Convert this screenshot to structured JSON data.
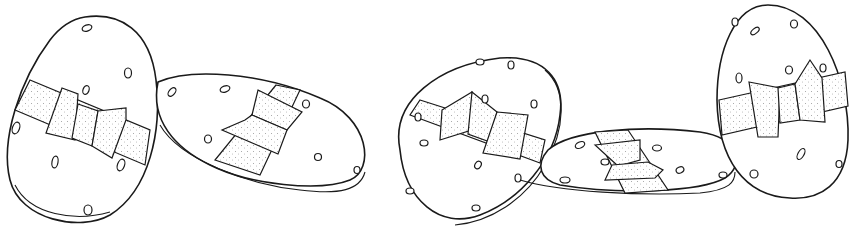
{
  "illustration": {
    "subject": "Four decorated Easter eggs with ribbon bows, line drawing",
    "style": "black ink outline on white, stippled ribbon",
    "colors": {
      "background": "#ffffff",
      "ink": "#1a1a1a"
    },
    "eggs": [
      {
        "name": "egg-1",
        "pose": "upright tilted left, front view"
      },
      {
        "name": "egg-2",
        "pose": "lying on its side, tilted"
      },
      {
        "name": "egg-3",
        "pose": "tilted, rim visible"
      },
      {
        "name": "egg-4",
        "pose": "lying flat, bow on top"
      },
      {
        "name": "egg-5",
        "pose": "upright, front view"
      }
    ]
  }
}
